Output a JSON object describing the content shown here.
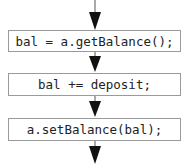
{
  "flowchart": {
    "steps": [
      {
        "label": "bal = a.getBalance();"
      },
      {
        "label": "bal += deposit;"
      },
      {
        "label": "a.setBalance(bal);"
      }
    ],
    "colors": {
      "border": "#9a9a9a",
      "arrow": "#111111",
      "text": "#222222"
    }
  }
}
